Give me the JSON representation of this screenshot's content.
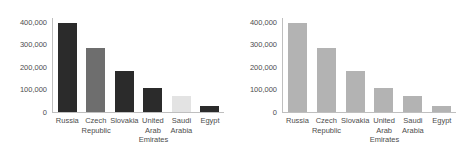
{
  "chart_data": [
    {
      "type": "bar",
      "title": "",
      "xlabel": "",
      "ylabel": "",
      "categories": [
        "Russia",
        "Czech Republic",
        "Slovakia",
        "United Arab Emirates",
        "Saudi Arabia",
        "Egypt"
      ],
      "category_lines": [
        [
          "Russia"
        ],
        [
          "Czech",
          "Republic"
        ],
        [
          "Slovakia"
        ],
        [
          "United",
          "Arab",
          "Emirates"
        ],
        [
          "Saudi",
          "Arabia"
        ],
        [
          "Egypt"
        ]
      ],
      "values": [
        392000,
        285000,
        180000,
        108000,
        73000,
        28000
      ],
      "bar_colors": [
        "#2b2b2b",
        "#6e6e6e",
        "#2b2b2b",
        "#2b2b2b",
        "#e3e3e3",
        "#2b2b2b"
      ],
      "ylim": [
        0,
        420000
      ],
      "yticks": [
        0,
        100000,
        200000,
        300000,
        400000
      ],
      "ytick_labels": [
        "0",
        "100,000",
        "200,000",
        "300,000",
        "400,000"
      ],
      "grid": false,
      "legend": "none"
    },
    {
      "type": "bar",
      "title": "",
      "xlabel": "",
      "ylabel": "",
      "categories": [
        "Russia",
        "Czech Republic",
        "Slovakia",
        "United Arab Emirates",
        "Saudi Arabia",
        "Egypt"
      ],
      "category_lines": [
        [
          "Russia"
        ],
        [
          "Czech",
          "Republic"
        ],
        [
          "Slovakia"
        ],
        [
          "United",
          "Arab",
          "Emirates"
        ],
        [
          "Saudi",
          "Arabia"
        ],
        [
          "Egypt"
        ]
      ],
      "values": [
        392000,
        285000,
        180000,
        108000,
        73000,
        28000
      ],
      "bar_colors": [
        "#b3b3b3",
        "#b3b3b3",
        "#b3b3b3",
        "#b3b3b3",
        "#b3b3b3",
        "#b3b3b3"
      ],
      "ylim": [
        0,
        420000
      ],
      "yticks": [
        0,
        100000,
        200000,
        300000,
        400000
      ],
      "ytick_labels": [
        "0",
        "100,000",
        "200,000",
        "300,000",
        "400,000"
      ],
      "grid": false,
      "legend": "none"
    }
  ],
  "style": {
    "background": "#ffffff",
    "axis_color": "#bfbfbf",
    "tick_text_color": "#4d4d4d"
  }
}
